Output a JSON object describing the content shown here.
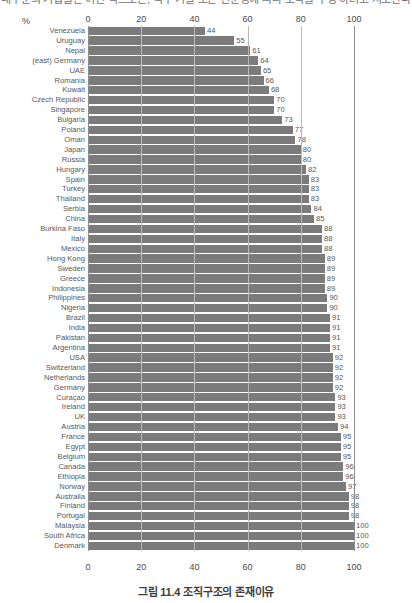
{
  "header": {
    "cut_text": "대부분의 기업들은 어떤 식으로든, 직무 기술 또는 전문성에 따라 조직을 구성 하려고 시도한다"
  },
  "caption": "그림 11.4 조직구조의 존재이유",
  "axis": {
    "unit_label": "%",
    "ticks": [
      "0",
      "20",
      "40",
      "60",
      "80",
      "100"
    ]
  },
  "colors": {
    "bar": "#7b7b7b",
    "grid": "#b9b9b9",
    "axis": "#8d8d8d",
    "text": "#585858"
  },
  "chart_data": {
    "type": "bar",
    "orientation": "horizontal",
    "title": "그림 11.4 조직구조의 존재이유",
    "xlabel": "%",
    "ylabel": "",
    "xlim": [
      0,
      100
    ],
    "grid": true,
    "legend": false,
    "categories": [
      "Venezuela",
      "Uruguay",
      "Nepal",
      "(east) Germany",
      "UAE",
      "Romania",
      "Kuwait",
      "Czech Republic",
      "Singapore",
      "Bulgaria",
      "Poland",
      "Oman",
      "Japan",
      "Russia",
      "Hungary",
      "Spain",
      "Turkey",
      "Thailand",
      "Serbia",
      "China",
      "Burkina Faso",
      "Italy",
      "Mexico",
      "Hong Kong",
      "Sweden",
      "Greece",
      "Indonesia",
      "Philippines",
      "Nigeria",
      "Brazil",
      "India",
      "Pakistan",
      "Argentina",
      "USA",
      "Switzerland",
      "Netherlands",
      "Germany",
      "Curaçao",
      "Ireland",
      "UK",
      "Austria",
      "France",
      "Egypt",
      "Belgium",
      "Canada",
      "Ethiopia",
      "Norway",
      "Australia",
      "Finland",
      "Portugal",
      "Malaysia",
      "South Africa",
      "Denmark"
    ],
    "values": [
      44,
      55,
      61,
      64,
      65,
      66,
      68,
      70,
      70,
      73,
      77,
      78,
      80,
      80,
      82,
      83,
      83,
      83,
      84,
      85,
      88,
      88,
      88,
      89,
      89,
      89,
      89,
      90,
      90,
      91,
      91,
      91,
      91,
      92,
      92,
      92,
      92,
      93,
      93,
      93,
      94,
      95,
      95,
      95,
      96,
      96,
      97,
      98,
      98,
      98,
      100,
      100,
      100
    ]
  }
}
